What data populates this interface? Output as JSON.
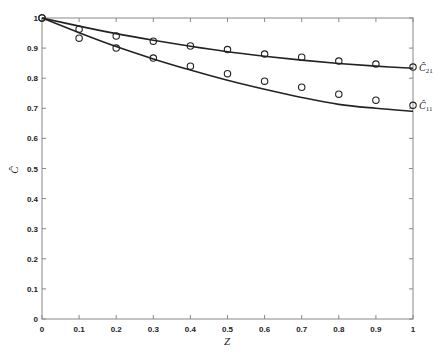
{
  "chart_data": {
    "type": "line",
    "title": "",
    "xlabel": "Z",
    "ylabel": "Ĉ",
    "xlim": [
      0,
      1
    ],
    "ylim": [
      0,
      1
    ],
    "xticks": [
      0,
      0.1,
      0.2,
      0.3,
      0.4,
      0.5,
      0.6,
      0.7,
      0.8,
      0.9,
      1
    ],
    "xtick_labels": [
      "0",
      "0.1",
      "0.2",
      "0.3",
      "0.4",
      "0.5",
      "0.6",
      "0.7",
      "0.8",
      "0.9",
      "1"
    ],
    "yticks": [
      0,
      0.1,
      0.2,
      0.3,
      0.4,
      0.5,
      0.6,
      0.7,
      0.8,
      0.9,
      1
    ],
    "ytick_labels": [
      "0",
      "0.1",
      "0.2",
      "0.3",
      "0.4",
      "0.5",
      "0.6",
      "0.7",
      "0.8",
      "0.9",
      "1"
    ],
    "grid": false,
    "legend": "inline labels at right edge",
    "series": [
      {
        "name": "Ĉ21",
        "label_main": "Ĉ",
        "label_sub": "21",
        "curve": {
          "x": [
            0,
            0.1,
            0.2,
            0.3,
            0.4,
            0.5,
            0.6,
            0.7,
            0.8,
            0.9,
            1.0
          ],
          "y": [
            1.0,
            0.973,
            0.948,
            0.926,
            0.906,
            0.888,
            0.873,
            0.86,
            0.849,
            0.84,
            0.833
          ]
        },
        "markers": {
          "x": [
            0,
            0.1,
            0.2,
            0.3,
            0.4,
            0.5,
            0.6,
            0.7,
            0.8,
            0.9,
            1.0
          ],
          "y": [
            1.0,
            0.963,
            0.94,
            0.923,
            0.907,
            0.895,
            0.88,
            0.87,
            0.857,
            0.847,
            0.837
          ]
        }
      },
      {
        "name": "Ĉ11",
        "label_main": "Ĉ",
        "label_sub": "11",
        "curve": {
          "x": [
            0,
            0.1,
            0.2,
            0.3,
            0.4,
            0.5,
            0.6,
            0.7,
            0.8,
            0.9,
            1.0
          ],
          "y": [
            1.0,
            0.951,
            0.905,
            0.864,
            0.827,
            0.793,
            0.763,
            0.736,
            0.713,
            0.7,
            0.69
          ]
        },
        "markers": {
          "x": [
            0,
            0.1,
            0.2,
            0.3,
            0.4,
            0.5,
            0.6,
            0.7,
            0.8,
            0.9,
            1.0
          ],
          "y": [
            1.0,
            0.933,
            0.9,
            0.867,
            0.84,
            0.815,
            0.79,
            0.77,
            0.747,
            0.727,
            0.71
          ]
        }
      }
    ]
  },
  "layout": {
    "plot_left": 42,
    "plot_right": 413,
    "plot_top": 18,
    "plot_bottom": 319,
    "line_color": "#222222",
    "axis_color": "#888888"
  }
}
